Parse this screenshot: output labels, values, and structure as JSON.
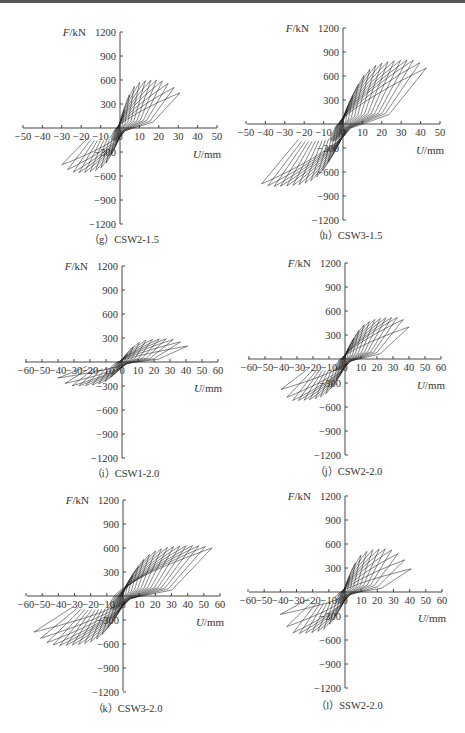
{
  "chart_data": [
    {
      "id": "g",
      "type": "line",
      "caption": "（g）CSW2-1.5",
      "xlabel": "U/mm",
      "ylabel": "F/kN",
      "xlim": [
        -50,
        50
      ],
      "ylim": [
        -1200,
        1200
      ],
      "xticks": [
        -50,
        -40,
        -30,
        -20,
        -10,
        0,
        10,
        20,
        30,
        40,
        50
      ],
      "yticks": [
        1200,
        900,
        600,
        300,
        -300,
        -600,
        -900,
        -1200
      ],
      "layout": {
        "x0": 23,
        "x1": 217,
        "ax": 120,
        "ay": 128,
        "yTop": 32,
        "yBot": 224,
        "capY": 243
      },
      "envelope": {
        "pos_peak_F": 600,
        "pos_peak_U": 18,
        "pos_max_U": 31,
        "pos_end_F": 440,
        "neg_peak_F": -560,
        "neg_peak_U": -22,
        "neg_min_U": -30,
        "neg_end_F": -460
      },
      "cycles": 11
    },
    {
      "id": "h",
      "type": "line",
      "caption": "（h）CSW3-1.5",
      "xlabel": "U/mm",
      "ylabel": "F/kN",
      "xlim": [
        -50,
        50
      ],
      "ylim": [
        -1200,
        1200
      ],
      "xticks": [
        -50,
        -40,
        -30,
        -20,
        -10,
        0,
        10,
        20,
        30,
        40,
        50
      ],
      "yticks": [
        1200,
        900,
        600,
        300,
        -300,
        -600,
        -900,
        -1200
      ],
      "layout": {
        "x0": 247,
        "x1": 440,
        "ax": 343,
        "ay": 124,
        "yTop": 28,
        "yBot": 220,
        "capY": 239
      },
      "envelope": {
        "pos_peak_F": 800,
        "pos_peak_U": 35,
        "pos_max_U": 43,
        "pos_end_F": 700,
        "neg_peak_F": -780,
        "neg_peak_U": -35,
        "neg_min_U": -42,
        "neg_end_F": -750
      },
      "cycles": 14
    },
    {
      "id": "i",
      "type": "line",
      "caption": "（i）CSW1-2.0",
      "xlabel": "U/mm",
      "ylabel": "F/kN",
      "xlim": [
        -60,
        60
      ],
      "ylim": [
        -1200,
        1200
      ],
      "xticks": [
        -60,
        -50,
        -40,
        -30,
        -20,
        -10,
        0,
        10,
        20,
        30,
        40,
        50,
        60
      ],
      "yticks": [
        1200,
        900,
        600,
        300,
        -300,
        -600,
        -900,
        -1200
      ],
      "layout": {
        "x0": 25,
        "x1": 218,
        "ax": 122,
        "ay": 362,
        "yTop": 266,
        "yBot": 458,
        "capY": 477
      },
      "envelope": {
        "pos_peak_F": 290,
        "pos_peak_U": 28,
        "pos_max_U": 41,
        "pos_end_F": 200,
        "neg_peak_F": -300,
        "neg_peak_U": -30,
        "neg_min_U": -40,
        "neg_end_F": -200
      },
      "cycles": 10
    },
    {
      "id": "j",
      "type": "line",
      "caption": "（j）CSW2-2.0",
      "xlabel": "U/mm",
      "ylabel": "F/kN",
      "xlim": [
        -60,
        60
      ],
      "ylim": [
        -1200,
        1200
      ],
      "xticks": [
        -60,
        -50,
        -40,
        -30,
        -20,
        -10,
        0,
        10,
        20,
        30,
        40,
        50,
        60
      ],
      "yticks": [
        1200,
        900,
        600,
        300,
        -300,
        -600,
        -900,
        -1200
      ],
      "layout": {
        "x0": 248,
        "x1": 441,
        "ax": 345,
        "ay": 359,
        "yTop": 263,
        "yBot": 455,
        "capY": 475
      },
      "envelope": {
        "pos_peak_F": 520,
        "pos_peak_U": 33,
        "pos_max_U": 40,
        "pos_end_F": 400,
        "neg_peak_F": -520,
        "neg_peak_U": -32,
        "neg_min_U": -40,
        "neg_end_F": -380
      },
      "cycles": 12
    },
    {
      "id": "k",
      "type": "line",
      "caption": "（k）CSW3-2.0",
      "xlabel": "U/mm",
      "ylabel": "F/kN",
      "xlim": [
        -60,
        60
      ],
      "ylim": [
        -1200,
        1200
      ],
      "xticks": [
        -60,
        -50,
        -40,
        -30,
        -20,
        -10,
        0,
        10,
        20,
        30,
        40,
        50,
        60
      ],
      "yticks": [
        1200,
        900,
        600,
        300,
        -300,
        -600,
        -900,
        -1200
      ],
      "layout": {
        "x0": 27,
        "x1": 220,
        "ax": 123,
        "ay": 596,
        "yTop": 500,
        "yBot": 691,
        "capY": 712
      },
      "envelope": {
        "pos_peak_F": 630,
        "pos_peak_U": 45,
        "pos_max_U": 55,
        "pos_end_F": 600,
        "neg_peak_F": -620,
        "neg_peak_U": -40,
        "neg_min_U": -55,
        "neg_end_F": -450
      },
      "cycles": 15
    },
    {
      "id": "l",
      "type": "line",
      "caption": "（l）SSW2-2.0",
      "xlabel": "U/mm",
      "ylabel": "F/kN",
      "xlim": [
        -60,
        60
      ],
      "ylim": [
        -1200,
        1200
      ],
      "xticks": [
        -60,
        -50,
        -40,
        -30,
        -20,
        -10,
        0,
        10,
        20,
        30,
        40,
        50,
        60
      ],
      "yticks": [
        1200,
        900,
        600,
        300,
        -300,
        -600,
        -900,
        -1200
      ],
      "layout": {
        "x0": 249,
        "x1": 442,
        "ax": 345,
        "ay": 592,
        "yTop": 496,
        "yBot": 688,
        "capY": 709
      },
      "envelope": {
        "pos_peak_F": 540,
        "pos_peak_U": 25,
        "pos_max_U": 41,
        "pos_end_F": 290,
        "neg_peak_F": -520,
        "neg_peak_U": -30,
        "neg_min_U": -40,
        "neg_end_F": -280
      },
      "cycles": 11
    }
  ]
}
